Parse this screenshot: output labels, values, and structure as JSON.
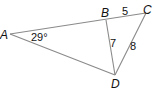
{
  "diagram": {
    "type": "geometry-triangle",
    "vertices": {
      "A": {
        "label": "A",
        "x": 10,
        "y": 34
      },
      "B": {
        "label": "B",
        "x": 106,
        "y": 20
      },
      "C": {
        "label": "C",
        "x": 146,
        "y": 13
      },
      "D": {
        "label": "D",
        "x": 115,
        "y": 75
      }
    },
    "segments": [
      {
        "from": "A",
        "to": "C",
        "note": "B lies on AC"
      },
      {
        "from": "A",
        "to": "D"
      },
      {
        "from": "B",
        "to": "D"
      },
      {
        "from": "C",
        "to": "D"
      }
    ],
    "measurements": {
      "angle_A": "29°",
      "BC": "5",
      "BD": "7",
      "CD": "8"
    }
  }
}
